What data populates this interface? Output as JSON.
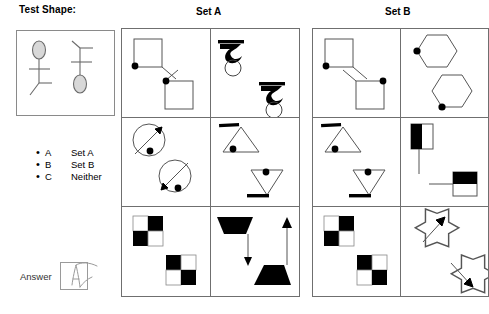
{
  "test_shape": {
    "title": "Test Shape:",
    "figures": [
      {
        "name": "stick-figure-ellipse-top",
        "ellipse_position": "top",
        "ellipse_fill": "#d8d8d8"
      },
      {
        "name": "stick-figure-ellipse-bottom",
        "ellipse_position": "bottom",
        "ellipse_fill": "#d8d8d8"
      }
    ]
  },
  "options": [
    {
      "bullet": "•",
      "letter": "A",
      "label": "Set A"
    },
    {
      "bullet": "•",
      "letter": "B",
      "label": "Set B"
    },
    {
      "bullet": "•",
      "letter": "C",
      "label": "Neither"
    }
  ],
  "answer": {
    "label": "Answer",
    "mark": "A",
    "marked": true
  },
  "sets": [
    {
      "id": "setA",
      "title": "Set A",
      "cells": [
        {
          "name": "cell-a1",
          "shapes": "squares-with-corner-dot-and-line",
          "dot_color": "#000000"
        },
        {
          "name": "cell-a2",
          "shapes": "black-zigzag-over-circle",
          "dot_color": "#000000"
        },
        {
          "name": "cell-a3",
          "shapes": "circles-with-diagonal-arrow-and-dot",
          "dot_color": "#000000"
        },
        {
          "name": "cell-a4",
          "shapes": "triangles-with-black-bar-and-dot",
          "dot_color": "#000000"
        },
        {
          "name": "cell-a5",
          "shapes": "checkerboard-2x2",
          "dot_color": "#000000"
        },
        {
          "name": "cell-a6",
          "shapes": "black-trapezoids-with-arrows",
          "dot_color": "#000000"
        }
      ]
    },
    {
      "id": "setB",
      "title": "Set B",
      "cells": [
        {
          "name": "cell-b1",
          "shapes": "squares-with-corner-dot-and-line-mirrored",
          "dot_color": "#000000"
        },
        {
          "name": "cell-b2",
          "shapes": "hexagons-with-vertex-dot",
          "dot_color": "#000000"
        },
        {
          "name": "cell-b3",
          "shapes": "triangles-with-black-bar-and-dot",
          "dot_color": "#000000"
        },
        {
          "name": "cell-b4",
          "shapes": "half-black-rectangles-with-line",
          "dot_color": "#000000"
        },
        {
          "name": "cell-b5",
          "shapes": "checkerboard-2x2",
          "dot_color": "#000000"
        },
        {
          "name": "cell-b6",
          "shapes": "eight-point-stars-with-arrow",
          "dot_color": "#000000"
        }
      ]
    }
  ],
  "colors": {
    "stroke": "#000000",
    "panel_border": "#6f6f6f",
    "box_border": "#8a8a8a",
    "fill_black": "#000000",
    "fill_white": "#ffffff",
    "ellipse_gray": "#d8d8d8"
  }
}
